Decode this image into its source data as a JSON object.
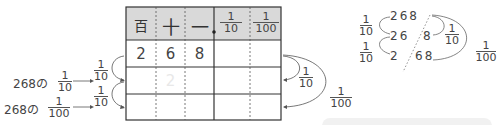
{
  "table": {
    "headers": [
      "百",
      "十",
      "一",
      {
        "num": "1",
        "den": "10"
      },
      {
        "num": "1",
        "den": "100"
      }
    ],
    "rows": [
      [
        "2",
        "6",
        "8",
        "",
        ""
      ],
      [
        "",
        "2",
        "",
        "",
        ""
      ],
      [
        "",
        "",
        "",
        "",
        ""
      ]
    ],
    "header_bg": "#d9d9d9"
  },
  "left_labels": [
    {
      "prefix": "268の",
      "num": "1",
      "den": "10"
    },
    {
      "prefix": "268の",
      "num": "1",
      "den": "100"
    }
  ],
  "left_arrows": [
    {
      "num": "1",
      "den": "10"
    },
    {
      "num": "1",
      "den": "10"
    }
  ],
  "right_arrows": [
    {
      "num": "1",
      "den": "10"
    },
    {
      "num": "1",
      "den": "100"
    }
  ],
  "example": {
    "lines": [
      {
        "left": "268",
        "right": ""
      },
      {
        "left": "26",
        "right": "8"
      },
      {
        "left": "2",
        "right": "68"
      }
    ],
    "left_fracs": [
      {
        "num": "1",
        "den": "10"
      },
      {
        "num": "1",
        "den": "10"
      }
    ],
    "right_fracs": [
      {
        "num": "1",
        "den": "10"
      },
      {
        "num": "1",
        "den": "100"
      }
    ]
  }
}
